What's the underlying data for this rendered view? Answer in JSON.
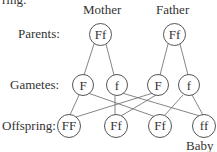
{
  "header_fragment": "ring:",
  "columns": {
    "mother": "Mother",
    "father": "Father"
  },
  "rows": {
    "parents": "Parents:",
    "gametes": "Gametes:",
    "offspring": "Offspring:"
  },
  "parents": [
    {
      "label": "Ff",
      "owner": "Mother"
    },
    {
      "label": "Ff",
      "owner": "Father"
    }
  ],
  "gametes": [
    {
      "label": "F"
    },
    {
      "label": "f"
    },
    {
      "label": "F"
    },
    {
      "label": "f"
    }
  ],
  "offspring": [
    {
      "label": "FF"
    },
    {
      "label": "Ff"
    },
    {
      "label": "Ff"
    },
    {
      "label": "ff"
    }
  ],
  "baby_label": "Baby"
}
